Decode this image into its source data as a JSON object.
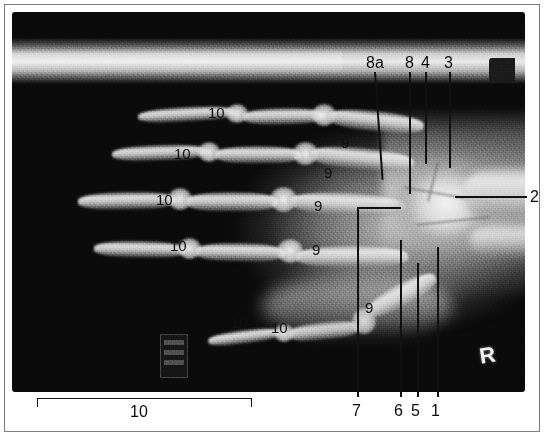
{
  "figure": {
    "kind": "radiograph",
    "modality": "x-ray",
    "view": "hand-dorsopalmar",
    "film_marker_right": "R",
    "background_color": "#ffffff",
    "film_color": "#0a0a0a",
    "annotation_color": "#111111"
  },
  "annotations": {
    "top": [
      {
        "label": "8a",
        "x": 372,
        "y": 62
      },
      {
        "label": "8",
        "x": 409,
        "y": 62
      },
      {
        "label": "4",
        "x": 424,
        "y": 62
      },
      {
        "label": "3",
        "x": 447,
        "y": 62
      }
    ],
    "right": [
      {
        "label": "2",
        "x": 533,
        "y": 190
      }
    ],
    "bottom": [
      {
        "label": "7",
        "x": 355,
        "y": 408
      },
      {
        "label": "6",
        "x": 397,
        "y": 408
      },
      {
        "label": "5",
        "x": 414,
        "y": 408
      },
      {
        "label": "1",
        "x": 434,
        "y": 408
      }
    ],
    "bottom_span": {
      "label": "10",
      "x": 136,
      "y": 408,
      "bracket_left": 37,
      "bracket_right": 251,
      "bracket_top": 398
    },
    "on_film": [
      {
        "label": "10",
        "x": 214,
        "y": 112
      },
      {
        "label": "10",
        "x": 180,
        "y": 153
      },
      {
        "label": "10",
        "x": 162,
        "y": 199
      },
      {
        "label": "10",
        "x": 176,
        "y": 245
      },
      {
        "label": "10",
        "x": 237,
        "y": 322
      },
      {
        "label": "10",
        "x": 277,
        "y": 327
      },
      {
        "label": "9",
        "x": 344,
        "y": 142
      },
      {
        "label": "9",
        "x": 327,
        "y": 172
      },
      {
        "label": "9",
        "x": 317,
        "y": 205
      },
      {
        "label": "9",
        "x": 315,
        "y": 249
      },
      {
        "label": "9",
        "x": 368,
        "y": 307
      }
    ]
  },
  "legend_keys": [
    "1",
    "2",
    "3",
    "4",
    "5",
    "6",
    "7",
    "8",
    "8a",
    "9",
    "10"
  ]
}
